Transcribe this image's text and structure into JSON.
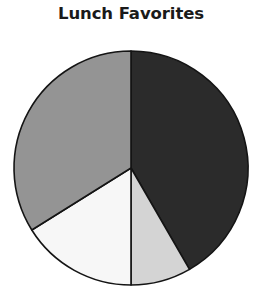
{
  "chart": {
    "title": "Lunch Favorites"
  },
  "chart_data": {
    "type": "pie",
    "title": "Lunch Favorites",
    "subtitle": "",
    "xlabel": "",
    "ylabel": "",
    "legend": "none",
    "grid": false,
    "labels": [
      "Slice 1",
      "Slice 2",
      "Slice 3",
      "Slice 4"
    ],
    "values": [
      41.7,
      8.3,
      16.1,
      33.9
    ],
    "units": "percent",
    "start_angle_deg": 0,
    "direction": "clockwise",
    "slices": [
      {
        "label": "Slice 1",
        "value": 41.7,
        "start_angle_deg": 0,
        "end_angle_deg": 150,
        "sweep_deg": 150,
        "color": "#2b2b2b",
        "shade": "dark"
      },
      {
        "label": "Slice 2",
        "value": 8.3,
        "start_angle_deg": 150,
        "end_angle_deg": 180,
        "sweep_deg": 30,
        "color": "#d4d4d4",
        "shade": "light-gray"
      },
      {
        "label": "Slice 3",
        "value": 16.1,
        "start_angle_deg": 180,
        "end_angle_deg": 238,
        "sweep_deg": 58,
        "color": "#f7f7f7",
        "shade": "white"
      },
      {
        "label": "Slice 4",
        "value": 33.9,
        "start_angle_deg": 238,
        "end_angle_deg": 360,
        "sweep_deg": 122,
        "color": "#949494",
        "shade": "medium-gray"
      }
    ],
    "geometry": {
      "center_x": 131,
      "center_y": 168,
      "radius": 117,
      "outline_color": "#141414",
      "outline_width": 1.6
    }
  }
}
